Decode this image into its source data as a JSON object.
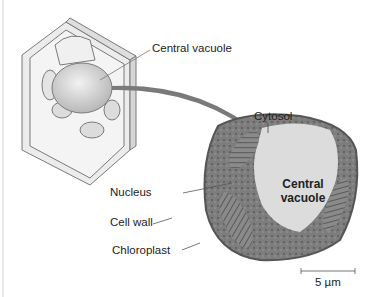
{
  "figure": {
    "diagram_labels": {
      "central_vacuole_callout": "Central vacuole",
      "cytosol": "Cytosol",
      "central_vacuole_inside_line1": "Central",
      "central_vacuole_inside_line2": "vacuole",
      "nucleus": "Nucleus",
      "cell_wall": "Cell wall",
      "chloroplast": "Chloroplast",
      "scale_bar": "5 µm"
    },
    "colors": {
      "arrow": "#7a7a7a",
      "micrograph_dark": "#6e6e6e",
      "vacuole_fill": "#dcdcdc",
      "sketch_line": "#7a7a7a"
    }
  }
}
